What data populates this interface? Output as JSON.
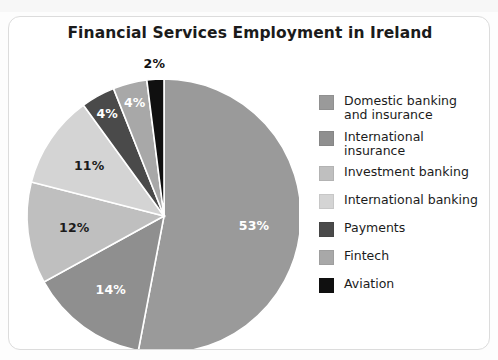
{
  "page": {
    "ghost_text_top": "",
    "background_color": "#fdfdfd",
    "card_border_color": "#dcdcdc"
  },
  "card": {
    "title": "Financial Services Employment in Ireland"
  },
  "chart_data": {
    "type": "pie",
    "title": "Financial Services Employment in Ireland",
    "xlabel": "",
    "ylabel": "",
    "units": "percent",
    "legend_position": "right",
    "grid": false,
    "start_angle_deg": 0,
    "direction": "clockwise",
    "categories": [
      "Domestic banking and insurance",
      "International insurance",
      "Investment banking",
      "International banking",
      "Payments",
      "Fintech",
      "Aviation"
    ],
    "values": [
      53,
      14,
      12,
      11,
      4,
      4,
      2
    ],
    "labels": [
      "53%",
      "14%",
      "12%",
      "11%",
      "4%",
      "4%",
      "2%"
    ],
    "colors": [
      "#9a9a9a",
      "#8f8f8f",
      "#bfbfbf",
      "#d4d4d4",
      "#4a4a4a",
      "#a8a8a8",
      "#101010"
    ],
    "slices": [
      {
        "name": "Domestic banking and insurance",
        "value": 53,
        "label": "53%",
        "color": "#9a9a9a",
        "label_color": "#ffffff",
        "legend_label_line1": "Domestic banking",
        "legend_label_line2": "and insurance"
      },
      {
        "name": "International insurance",
        "value": 14,
        "label": "14%",
        "color": "#8f8f8f",
        "label_color": "#ffffff",
        "legend_label_line1": "International insurance",
        "legend_label_line2": ""
      },
      {
        "name": "Investment banking",
        "value": 12,
        "label": "12%",
        "color": "#bfbfbf",
        "label_color": "#1b1b1b",
        "legend_label_line1": "Investment banking",
        "legend_label_line2": ""
      },
      {
        "name": "International banking",
        "value": 11,
        "label": "11%",
        "color": "#d4d4d4",
        "label_color": "#1b1b1b",
        "legend_label_line1": "International banking",
        "legend_label_line2": ""
      },
      {
        "name": "Payments",
        "value": 4,
        "label": "4%",
        "color": "#4a4a4a",
        "label_color": "#ffffff",
        "legend_label_line1": "Payments",
        "legend_label_line2": ""
      },
      {
        "name": "Fintech",
        "value": 4,
        "label": "4%",
        "color": "#a8a8a8",
        "label_color": "#ffffff",
        "legend_label_line1": "Fintech",
        "legend_label_line2": ""
      },
      {
        "name": "Aviation",
        "value": 2,
        "label": "2%",
        "color": "#101010",
        "label_color": "#111111",
        "legend_label_line1": "Aviation",
        "legend_label_line2": ""
      }
    ]
  }
}
